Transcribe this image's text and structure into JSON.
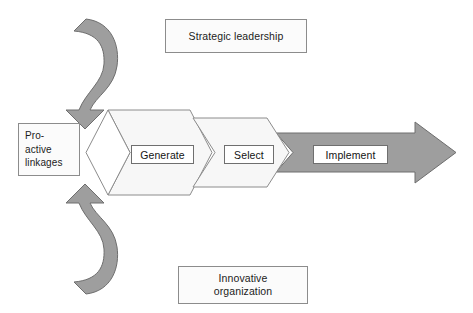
{
  "diagram": {
    "colors": {
      "ribbon_fill": "#9e9e9e",
      "ribbon_stroke": "#6e6e6e",
      "chevron_fill": "#f7f7f7",
      "chevron_stroke": "#8c8c8c",
      "arrow_fill": "#9e9e9e",
      "arrow_stroke": "#6e6e6e",
      "box_fill": "#fbfbfb",
      "box_stroke": "#8c8c8c",
      "label_fill": "#ffffff",
      "label_stroke": "#6f6f6f",
      "text": "#1b1b1b",
      "background": "#ffffff"
    },
    "context_boxes": {
      "top": {
        "label": "Strategic leadership"
      },
      "bottom": {
        "label": "Innovative\norganization"
      },
      "left": {
        "label": "Pro-\nactive\nlinkages"
      }
    },
    "stages": [
      {
        "id": "generate",
        "label": "Generate"
      },
      {
        "id": "select",
        "label": "Select"
      },
      {
        "id": "implement",
        "label": "Implement"
      }
    ],
    "ribbons": [
      {
        "id": "upper-feedback-ribbon",
        "direction": "curves down from top into the funnel mouth"
      },
      {
        "id": "lower-feedback-ribbon",
        "direction": "curves up from bottom into the funnel mouth"
      }
    ]
  }
}
